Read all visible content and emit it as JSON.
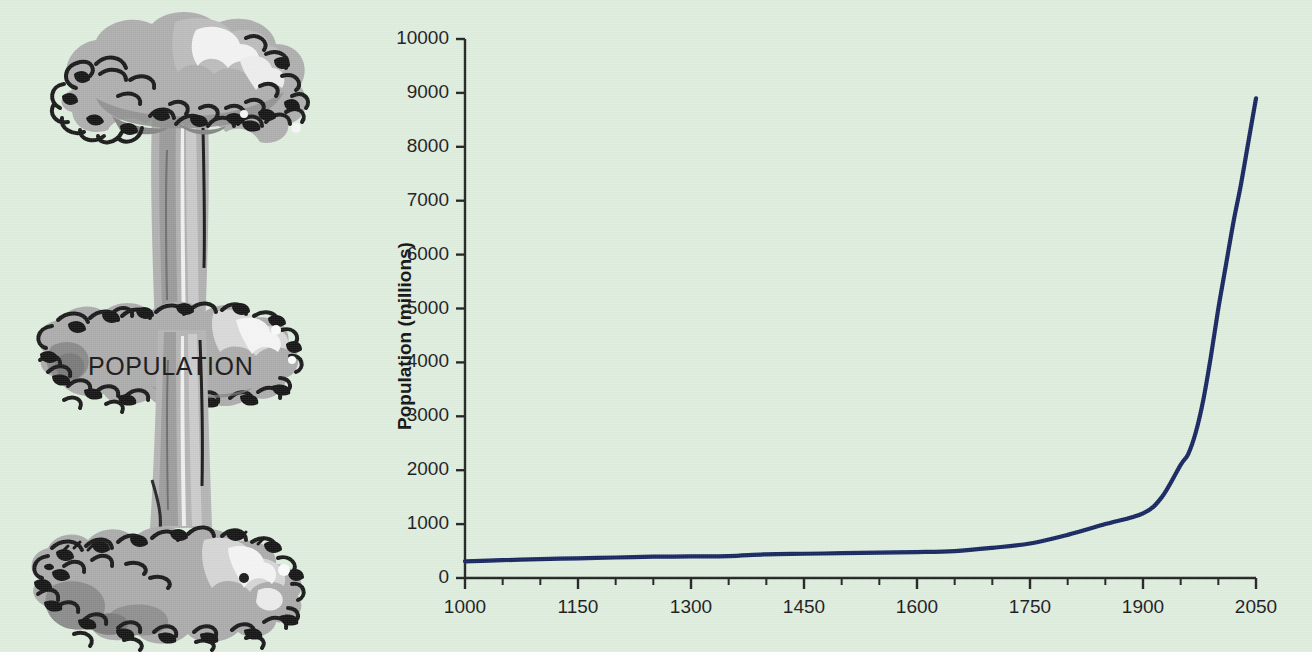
{
  "page": {
    "background_color": "#dfeddf",
    "illustration_caption": "POPULATION"
  },
  "illustration": {
    "name": "mushroom-cloud",
    "caption": "POPULATION",
    "colors": {
      "cloud_mid": "#a9a9a9",
      "cloud_dark": "#8d8d8d",
      "cloud_light": "#f2f2f2",
      "ink": "#1a1a1a"
    }
  },
  "chart_data": {
    "type": "line",
    "title": "",
    "subtitle": "",
    "xlabel": "",
    "ylabel": "Population (millions)",
    "xlim": [
      1000,
      2050
    ],
    "ylim": [
      0,
      10000
    ],
    "grid": false,
    "legend": null,
    "line_color": "#16255e",
    "x_ticks": [
      1000,
      1150,
      1300,
      1450,
      1600,
      1750,
      1900,
      2050
    ],
    "x_tick_labels": [
      "1000",
      "1150",
      "1300",
      "1450",
      "1600",
      "1750",
      "1900",
      "2050"
    ],
    "x_minor_tick_step": 50,
    "y_ticks": [
      0,
      1000,
      2000,
      3000,
      4000,
      5000,
      6000,
      7000,
      8000,
      9000,
      10000
    ],
    "y_tick_labels": [
      "0",
      "1000",
      "2000",
      "3000",
      "4000",
      "5000",
      "6000",
      "7000",
      "8000",
      "9000",
      "10000"
    ],
    "series": [
      {
        "name": "World population",
        "x": [
          1000,
          1050,
          1100,
          1150,
          1200,
          1250,
          1300,
          1350,
          1400,
          1450,
          1500,
          1550,
          1600,
          1650,
          1700,
          1750,
          1800,
          1850,
          1900,
          1925,
          1950,
          1960,
          1970,
          1980,
          1990,
          2000,
          2010,
          2020,
          2030,
          2040,
          2050
        ],
        "y": [
          310,
          330,
          350,
          365,
          380,
          395,
          400,
          405,
          440,
          450,
          460,
          470,
          480,
          500,
          560,
          640,
          800,
          1000,
          1200,
          1500,
          2100,
          2300,
          2700,
          3300,
          4100,
          5000,
          5800,
          6600,
          7300,
          8100,
          8900
        ]
      }
    ]
  }
}
